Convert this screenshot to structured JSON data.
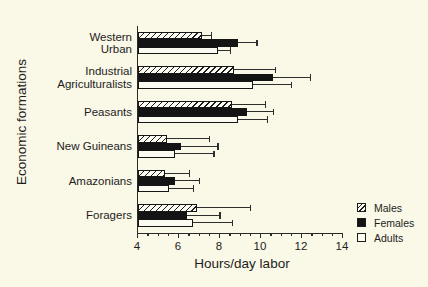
{
  "page": {
    "background": "#faf8e7"
  },
  "colors": {
    "ink": "#1d1d1d",
    "bar_black": "#141414",
    "bar_open_fill": "#fcfbf1",
    "paper": "#faf8e7"
  },
  "chart_data": {
    "type": "bar",
    "orientation": "horizontal",
    "title": "",
    "xlabel": "Hours/day labor",
    "ylabel": "Economic formations",
    "xlim": [
      4,
      14
    ],
    "xticks": [
      4,
      6,
      8,
      10,
      12,
      14
    ],
    "minor_tick_step": 0.5,
    "grid": "off",
    "error_bars": "upper only",
    "categories": [
      "Western Urban",
      "Industrial Agriculturalists",
      "Peasants",
      "New Guineans",
      "Amazonians",
      "Foragers"
    ],
    "category_lines": [
      [
        "Western",
        "Urban"
      ],
      [
        "Industrial",
        "Agriculturalists"
      ],
      [
        "Peasants"
      ],
      [
        "New Guineans"
      ],
      [
        "Amazonians"
      ],
      [
        "Foragers"
      ]
    ],
    "series": [
      {
        "name": "Males",
        "style": "hatched",
        "values": [
          7.1,
          8.7,
          8.6,
          5.4,
          5.3,
          6.9
        ],
        "error_high": [
          7.6,
          10.7,
          10.2,
          7.5,
          6.5,
          9.5
        ]
      },
      {
        "name": "Females",
        "style": "solid",
        "values": [
          8.9,
          10.6,
          9.3,
          6.1,
          5.8,
          6.4
        ],
        "error_high": [
          9.8,
          12.4,
          10.6,
          7.9,
          7.0,
          8.0
        ]
      },
      {
        "name": "Adults",
        "style": "open",
        "values": [
          7.9,
          9.6,
          8.9,
          5.8,
          5.5,
          6.7
        ],
        "error_high": [
          8.5,
          11.5,
          10.3,
          7.7,
          6.7,
          8.6
        ]
      }
    ],
    "legend": {
      "items": [
        "Males",
        "Females",
        "Adults"
      ],
      "position": "lower right"
    }
  }
}
